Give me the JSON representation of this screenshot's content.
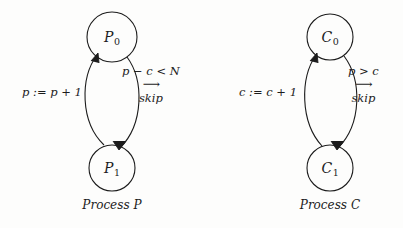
{
  "figure": {
    "background_color": "#fdfdfc",
    "ink_color": "#1c1c1c",
    "arrow_glyph": "⟶"
  },
  "diagrams": [
    {
      "id": "process-p",
      "caption_prefix": "Process",
      "caption_name": "P",
      "nodes": [
        {
          "id": "p0",
          "base": "P",
          "subscript": "0",
          "cx": 112,
          "cy": 37,
          "r": 25
        },
        {
          "id": "p1",
          "base": "P",
          "subscript": "1",
          "cx": 112,
          "cy": 168,
          "r": 23
        }
      ],
      "edges": [
        {
          "id": "p-up",
          "direction": "P1-to-P0",
          "label_kind": "assignment",
          "label": "p := p + 1",
          "label_x": 52,
          "label_y": 92
        },
        {
          "id": "p-down",
          "direction": "P0-to-P1",
          "label_kind": "guarded-command",
          "guard": "p − c < N",
          "arrow": "⟶",
          "body": "skip",
          "label_x": 156,
          "label_y": 96
        }
      ]
    },
    {
      "id": "process-c",
      "caption_prefix": "Process",
      "caption_name": "C",
      "nodes": [
        {
          "id": "c0",
          "base": "C",
          "subscript": "0",
          "cx": 130,
          "cy": 37,
          "r": 23
        },
        {
          "id": "c1",
          "base": "C",
          "subscript": "1",
          "cx": 130,
          "cy": 168,
          "r": 23
        }
      ],
      "edges": [
        {
          "id": "c-up",
          "direction": "C1-to-C0",
          "label_kind": "assignment",
          "label": "c := c + 1",
          "label_x": 68,
          "label_y": 92
        },
        {
          "id": "c-down",
          "direction": "C0-to-C1",
          "label_kind": "guarded-command",
          "guard": "p > c",
          "arrow": "⟶",
          "body": "skip",
          "label_x": 170,
          "label_y": 96
        }
      ]
    }
  ]
}
